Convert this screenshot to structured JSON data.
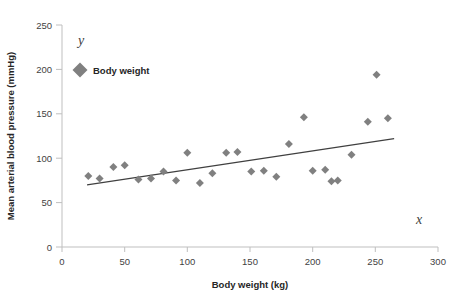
{
  "chart_data": {
    "type": "scatter",
    "title": "",
    "xlabel": "Body weight (kg)",
    "ylabel": "Mean arterial blood pressure (mmHg)",
    "xlim": [
      0,
      300
    ],
    "ylim": [
      0,
      250
    ],
    "xticks": [
      0,
      50,
      100,
      150,
      200,
      250,
      300
    ],
    "yticks": [
      0,
      50,
      100,
      150,
      200,
      250
    ],
    "xtick_labels": [
      "0",
      "50",
      "100",
      "150",
      "200",
      "250",
      "300"
    ],
    "ytick_labels": [
      "0",
      "50",
      "100",
      "150",
      "200",
      "250"
    ],
    "grid": false,
    "legend": {
      "position": "top-left-inside",
      "entries": [
        {
          "name": "Body weight",
          "marker": "diamond",
          "color": "#808080"
        }
      ]
    },
    "axis_annotations": {
      "y_symbol": "y",
      "x_symbol": "x"
    },
    "series": [
      {
        "name": "Body weight",
        "marker": "diamond",
        "color": "#808080",
        "points": [
          {
            "x": 21,
            "y": 80
          },
          {
            "x": 30,
            "y": 77
          },
          {
            "x": 41,
            "y": 90
          },
          {
            "x": 50,
            "y": 92
          },
          {
            "x": 61,
            "y": 76
          },
          {
            "x": 71,
            "y": 77
          },
          {
            "x": 81,
            "y": 85
          },
          {
            "x": 91,
            "y": 75
          },
          {
            "x": 100,
            "y": 106
          },
          {
            "x": 110,
            "y": 72
          },
          {
            "x": 120,
            "y": 83
          },
          {
            "x": 131,
            "y": 106
          },
          {
            "x": 140,
            "y": 107
          },
          {
            "x": 151,
            "y": 85
          },
          {
            "x": 161,
            "y": 86
          },
          {
            "x": 171,
            "y": 79
          },
          {
            "x": 181,
            "y": 116
          },
          {
            "x": 193,
            "y": 146
          },
          {
            "x": 200,
            "y": 86
          },
          {
            "x": 210,
            "y": 87
          },
          {
            "x": 215,
            "y": 74
          },
          {
            "x": 220,
            "y": 75
          },
          {
            "x": 231,
            "y": 104
          },
          {
            "x": 244,
            "y": 141
          },
          {
            "x": 251,
            "y": 194
          },
          {
            "x": 260,
            "y": 145
          }
        ]
      }
    ],
    "trendline": {
      "type": "linear",
      "color": "#404040",
      "x_start": 20,
      "y_start": 70,
      "x_end": 265,
      "y_end": 122
    }
  }
}
